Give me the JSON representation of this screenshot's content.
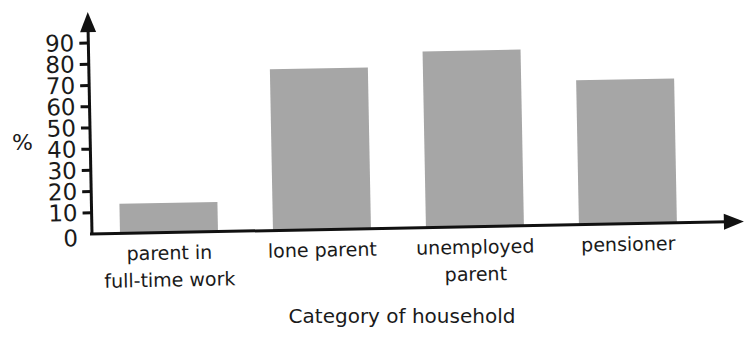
{
  "chart_data": {
    "type": "bar",
    "title": "",
    "xlabel": "Category of household",
    "ylabel": "%",
    "categories": [
      [
        "parent in",
        "full-time work"
      ],
      [
        "lone parent"
      ],
      [
        "unemployed",
        "parent"
      ],
      [
        "pensioner"
      ]
    ],
    "category_names": [
      "parent in full-time work",
      "lone parent",
      "unemployed parent",
      "pensioner"
    ],
    "values": [
      14,
      76,
      83,
      68
    ],
    "ylim": [
      0,
      90
    ],
    "yticks": [
      0,
      10,
      20,
      30,
      40,
      50,
      60,
      70,
      80,
      90
    ],
    "grid": false,
    "legend": "none",
    "bar_color": "#a6a6a6",
    "axis_color": "#111111"
  }
}
